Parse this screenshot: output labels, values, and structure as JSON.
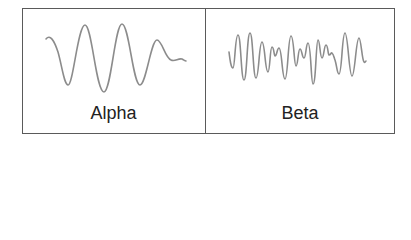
{
  "diagram": {
    "type": "brainwave-comparison",
    "panels": [
      {
        "label": "Alpha",
        "description": "Smooth, regular, high-amplitude slow oscillation that dampens at the end",
        "wave_color": "#8c8c8c"
      },
      {
        "label": "Beta",
        "description": "Fast, irregular, lower-amplitude oscillation",
        "wave_color": "#8c8c8c"
      }
    ],
    "border_color": "#5a5a5a",
    "text_color": "#222222"
  }
}
